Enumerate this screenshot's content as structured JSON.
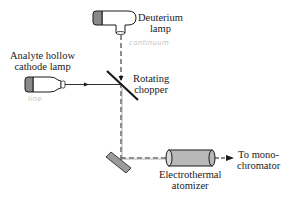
{
  "diagram": {
    "type": "optical-path-schematic",
    "components": {
      "deuterium_lamp": {
        "label_line1": "Deuterium",
        "label_line2": "lamp",
        "annotation": "continuum"
      },
      "hollow_cathode_lamp": {
        "label_line1": "Analyte hollow",
        "label_line2": "cathode lamp",
        "annotation": "line"
      },
      "chopper": {
        "label_line1": "Rotating",
        "label_line2": "chopper"
      },
      "atomizer": {
        "label_line1": "Electrothermal",
        "label_line2": "atomizer"
      },
      "output": {
        "label_line1": "To mono-",
        "label_line2": "chromator"
      }
    },
    "colors": {
      "line": "#1a1a1a",
      "lamp_cap": "#8a8a8a",
      "atomizer_fill": "#b8b8b8",
      "annotation": "#c4c4c4"
    }
  }
}
